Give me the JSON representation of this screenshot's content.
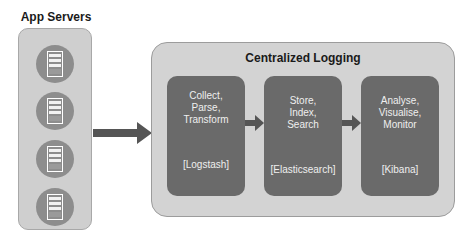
{
  "app_servers": {
    "title": "App Servers",
    "servers": [
      {
        "icon": "server-icon"
      },
      {
        "icon": "server-icon"
      },
      {
        "icon": "server-icon"
      },
      {
        "icon": "server-icon"
      }
    ]
  },
  "centralized_logging": {
    "title": "Centralized Logging",
    "stages": [
      {
        "lines": [
          "Collect,",
          "Parse,",
          "Transform"
        ],
        "tool": "[Logstash]"
      },
      {
        "lines": [
          "Store,",
          "Index,",
          "Search"
        ],
        "tool": "[Elasticsearch]"
      },
      {
        "lines": [
          "Analyse,",
          "Visualise,",
          "Monitor"
        ],
        "tool": "[Kibana]"
      }
    ]
  },
  "colors": {
    "container_fill": "#d3d3d3",
    "stage_fill": "#6a6a6a",
    "arrow_fill": "#555555",
    "server_circle": "#8d8d8d"
  }
}
